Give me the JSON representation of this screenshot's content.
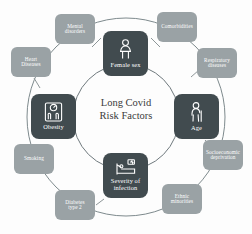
{
  "figure": {
    "center_title": "Long Covid\nRisk Factors",
    "colors": {
      "background": "#fdfdfd",
      "inner_node": "#414b4f",
      "outer_node": "#9aa2a5",
      "ring_stroke": "#6f797d",
      "connector_stroke": "#8d9698",
      "label_text": "#ffffff",
      "center_text": "#3b3b3b"
    }
  },
  "inner_nodes": [
    {
      "id": "female-sex",
      "label": "Female sex",
      "icon": "female-figure-icon",
      "position": "top"
    },
    {
      "id": "age",
      "label": "Age",
      "icon": "elderly-person-icon",
      "position": "right"
    },
    {
      "id": "severity-of-infection",
      "label": "Severity of\ninfection",
      "icon": "hospital-bed-icon",
      "position": "bottom"
    },
    {
      "id": "obesity",
      "label": "Obesity",
      "icon": "weight-scale-icon",
      "position": "left"
    }
  ],
  "outer_nodes": [
    {
      "id": "mental-disorders",
      "label": "Mental\ndisorders"
    },
    {
      "id": "comorbidities",
      "label": "Comorbidities"
    },
    {
      "id": "respiratory-diseases",
      "label": "Respiratory\ndiseases"
    },
    {
      "id": "socioeconomic-deprivation",
      "label": "Socioeconomic\ndeprivation"
    },
    {
      "id": "ethnic-minorities",
      "label": "Ethnic\nminorities"
    },
    {
      "id": "diabetes-type-2",
      "label": "Diabetes\ntype 2"
    },
    {
      "id": "smoking",
      "label": "Smoking"
    },
    {
      "id": "heart-diseases",
      "label": "Heart\nDiseases"
    }
  ]
}
